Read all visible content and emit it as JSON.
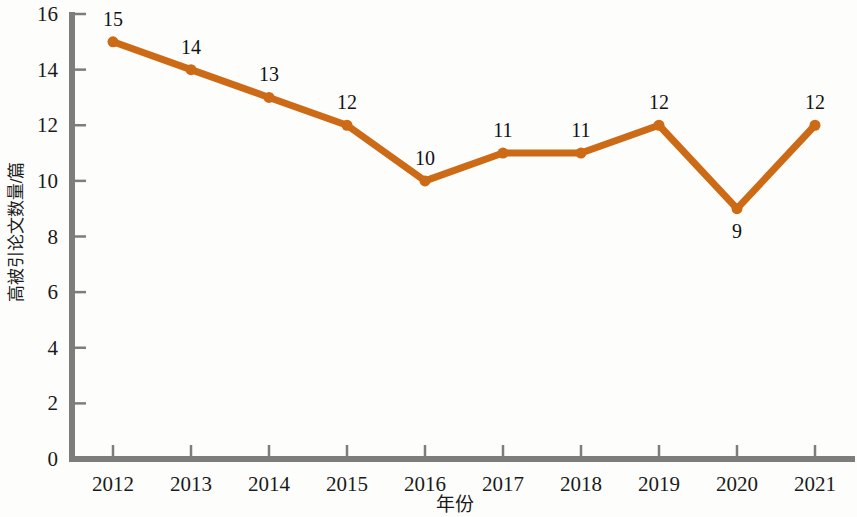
{
  "chart_data": {
    "type": "line",
    "title": "",
    "subtitle": "",
    "xlabel": "年份",
    "ylabel": "高被引论文数量/篇",
    "categories": [
      "2012",
      "2013",
      "2014",
      "2015",
      "2016",
      "2017",
      "2018",
      "2019",
      "2020",
      "2021"
    ],
    "values": [
      15,
      14,
      13,
      12,
      10,
      11,
      11,
      12,
      9,
      12
    ],
    "point_labels": [
      "15",
      "14",
      "13",
      "12",
      "10",
      "11",
      "11",
      "12",
      "9",
      "12"
    ],
    "point_label_position": [
      "above",
      "above",
      "above",
      "above",
      "above",
      "above",
      "above",
      "above",
      "below",
      "above"
    ],
    "series": [
      {
        "name": "高被引论文数量",
        "values": [
          15,
          14,
          13,
          12,
          10,
          11,
          11,
          12,
          9,
          12
        ],
        "color": "#CC6A16",
        "marker": "circle",
        "line_width": 7
      }
    ],
    "ylim": [
      0,
      16
    ],
    "xlim": [
      "2012",
      "2021"
    ],
    "y_ticks": [
      0,
      2,
      4,
      6,
      8,
      10,
      12,
      14,
      16
    ],
    "y_tick_labels": [
      "0",
      "2",
      "4",
      "6",
      "8",
      "10",
      "12",
      "14",
      "16"
    ],
    "x_tick_labels": [
      "2012",
      "2013",
      "2014",
      "2015",
      "2016",
      "2017",
      "2018",
      "2019",
      "2020",
      "2021"
    ],
    "grid": false,
    "legend": false,
    "legend_position": "none",
    "axis_color": "#7d7d7d",
    "text_color": "#1a1a1a",
    "background_color": "#fdfdfc",
    "accent_color": "#CC6A16"
  }
}
